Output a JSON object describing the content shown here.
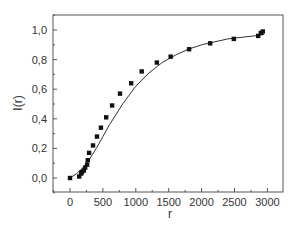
{
  "chart_data": {
    "type": "scatter",
    "title": "",
    "xlabel": "r",
    "ylabel": "I(r)",
    "xlim": [
      -250,
      3250
    ],
    "ylim": [
      -0.1,
      1.1
    ],
    "x_ticks": [
      0,
      500,
      1000,
      1500,
      2000,
      2500,
      3000
    ],
    "x_tick_labels": [
      "0",
      "500",
      "1000",
      "1500",
      "2000",
      "2500",
      "3000"
    ],
    "y_ticks": [
      0.0,
      0.2,
      0.4,
      0.6,
      0.8,
      1.0
    ],
    "y_tick_labels": [
      "0,0",
      "0,2",
      "0,4",
      "0,6",
      "0,8",
      "1,0"
    ],
    "grid": false,
    "legend": null,
    "series": [
      {
        "name": "measured",
        "marker": "square",
        "color": "#111111",
        "x": [
          0,
          140,
          170,
          180,
          210,
          230,
          260,
          270,
          290,
          350,
          410,
          470,
          550,
          640,
          760,
          930,
          1090,
          1320,
          1530,
          1810,
          2130,
          2490,
          2860,
          2900,
          2930
        ],
        "y": [
          0.0,
          0.01,
          0.03,
          0.04,
          0.05,
          0.07,
          0.09,
          0.12,
          0.17,
          0.22,
          0.28,
          0.34,
          0.41,
          0.49,
          0.57,
          0.64,
          0.72,
          0.78,
          0.82,
          0.87,
          0.91,
          0.94,
          0.96,
          0.98,
          0.99
        ]
      },
      {
        "name": "fit",
        "line": "solid",
        "color": "#333333",
        "x": [
          0,
          100,
          200,
          300,
          400,
          500,
          600,
          700,
          800,
          900,
          1000,
          1200,
          1400,
          1600,
          1800,
          2000,
          2200,
          2400,
          2600,
          2800,
          2950
        ],
        "y": [
          0.0,
          0.03,
          0.07,
          0.13,
          0.2,
          0.28,
          0.36,
          0.43,
          0.5,
          0.56,
          0.62,
          0.71,
          0.78,
          0.83,
          0.87,
          0.9,
          0.92,
          0.94,
          0.95,
          0.96,
          0.97
        ]
      }
    ]
  }
}
